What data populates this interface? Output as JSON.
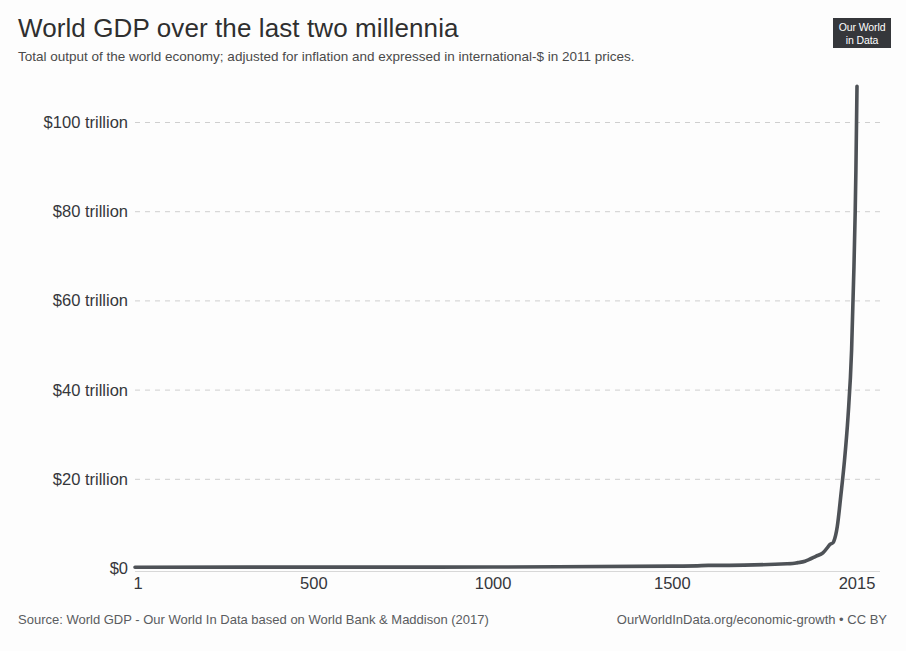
{
  "header": {
    "title": "World GDP over the last two millennia",
    "subtitle": "Total output of the world economy; adjusted for inflation and expressed in international-$ in 2011 prices."
  },
  "logo": {
    "line1": "Our World",
    "line2": "in Data"
  },
  "footer": {
    "source": "Source: World GDP - Our World In Data based on World Bank & Maddison (2017)",
    "license": "OurWorldInData.org/economic-growth • CC BY"
  },
  "colors": {
    "line": "#4e5257",
    "grid": "#cfcfcf",
    "text": "#35373b",
    "title": "#2f2f2f",
    "logo_bg": "#35373b",
    "background": "#fdfdfd"
  },
  "chart_data": {
    "type": "line",
    "title": "World GDP over the last two millennia",
    "subtitle": "Total output of the world economy; adjusted for inflation and expressed in international-$ in 2011 prices.",
    "xlabel": "",
    "ylabel": "",
    "xlim": [
      1,
      2015
    ],
    "ylim": [
      0,
      110
    ],
    "y_unit": "trillion international-$ (2011 prices)",
    "grid": true,
    "legend": "none",
    "x_ticks": [
      {
        "value": 1,
        "label": "1"
      },
      {
        "value": 500,
        "label": "500"
      },
      {
        "value": 1000,
        "label": "1000"
      },
      {
        "value": 1500,
        "label": "1500"
      },
      {
        "value": 2015,
        "label": "2015"
      }
    ],
    "y_ticks": [
      {
        "value": 0,
        "label": "$0"
      },
      {
        "value": 20,
        "label": "$20 trillion"
      },
      {
        "value": 40,
        "label": "$40 trillion"
      },
      {
        "value": 60,
        "label": "$60 trillion"
      },
      {
        "value": 80,
        "label": "$80 trillion"
      },
      {
        "value": 100,
        "label": "$100 trillion"
      }
    ],
    "series": [
      {
        "name": "World GDP",
        "x": [
          1,
          500,
          1000,
          1500,
          1600,
          1700,
          1820,
          1850,
          1870,
          1900,
          1920,
          1940,
          1950,
          1960,
          1970,
          1980,
          1990,
          2000,
          2010,
          2015
        ],
        "values": [
          0.18,
          0.2,
          0.21,
          0.43,
          0.58,
          0.64,
          0.95,
          1.2,
          1.5,
          2.6,
          3.4,
          5.3,
          5.9,
          9.3,
          16.3,
          24.0,
          34.0,
          49.0,
          80.0,
          108.0
        ]
      }
    ],
    "annotation": "Nearly flat from year 1 until ~1800, then a near-vertical hockey-stick rise to roughly $108 trillion by 2015."
  }
}
